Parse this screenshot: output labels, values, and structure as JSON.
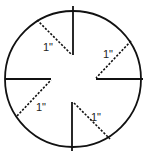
{
  "diagram": {
    "type": "circle-with-cuts",
    "circle": {
      "cx": 73,
      "cy": 79,
      "r": 68,
      "stroke": "#111111"
    },
    "solid_segments": [
      {
        "name": "top-radial-cut",
        "x1": 73,
        "y1": 6,
        "x2": 73,
        "y2": 55
      },
      {
        "name": "right-radial-cut",
        "x1": 96,
        "y1": 79,
        "x2": 143,
        "y2": 79
      },
      {
        "name": "bottom-radial-cut",
        "x1": 72,
        "y1": 102,
        "x2": 72,
        "y2": 151
      },
      {
        "name": "left-radial-cut",
        "x1": 5,
        "y1": 79,
        "x2": 51,
        "y2": 79
      }
    ],
    "dashed_segments": [
      {
        "name": "top-left-dashed",
        "x1": 37,
        "y1": 20,
        "x2": 72,
        "y2": 55
      },
      {
        "name": "top-right-dashed",
        "x1": 131,
        "y1": 41,
        "x2": 96,
        "y2": 78
      },
      {
        "name": "bottom-left-dashed",
        "x1": 17,
        "y1": 116,
        "x2": 51,
        "y2": 80
      },
      {
        "name": "bottom-right-dashed",
        "x1": 74,
        "y1": 103,
        "x2": 110,
        "y2": 139
      }
    ],
    "labels": [
      {
        "name": "label-top-left",
        "text": "1\"",
        "x": 43,
        "y": 51
      },
      {
        "name": "label-top-right",
        "text": "1\"",
        "x": 103,
        "y": 58
      },
      {
        "name": "label-bottom-left",
        "text": "1\"",
        "x": 36,
        "y": 111
      },
      {
        "name": "label-bottom-right",
        "text": "1\"",
        "x": 91,
        "y": 121
      }
    ]
  }
}
